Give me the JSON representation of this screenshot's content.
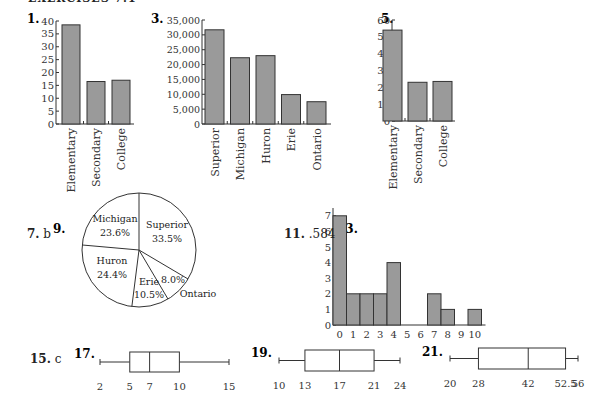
{
  "heading": "EXERCISES 7.1",
  "answers": {
    "ex7": {
      "label": "7.",
      "value": "b"
    },
    "ex11": {
      "label": "11.",
      "value": ".584"
    },
    "ex15": {
      "label": "15.",
      "value": "c"
    }
  },
  "chart_data": [
    {
      "id": "ex1",
      "label": "1.",
      "type": "bar",
      "categories": [
        "Elementary",
        "Secondary",
        "College"
      ],
      "values": [
        38.5,
        16.5,
        17
      ],
      "yticks": [
        0,
        5,
        10,
        15,
        20,
        25,
        30,
        35,
        40
      ],
      "ylim": [
        0,
        40
      ]
    },
    {
      "id": "ex3",
      "label": "3.",
      "type": "bar",
      "categories": [
        "Superior",
        "Michigan",
        "Huron",
        "Erie",
        "Ontario"
      ],
      "values": [
        31700,
        22300,
        23000,
        9900,
        7500
      ],
      "yticks": [
        "0",
        "5,000",
        "10,000",
        "15,000",
        "20,000",
        "25,000",
        "30,000",
        "35,000"
      ],
      "ylim": [
        0,
        35000
      ]
    },
    {
      "id": "ex5",
      "label": "5.",
      "type": "bar",
      "categories": [
        "Elementary",
        "Secondary",
        "College"
      ],
      "values": [
        54,
        23,
        23.5
      ],
      "yticks": [
        0,
        10,
        20,
        30,
        40,
        50,
        60
      ],
      "ylim": [
        0,
        60
      ]
    },
    {
      "id": "ex9",
      "label": "9.",
      "type": "pie",
      "slices": [
        {
          "name": "Superior",
          "pct": "33.5%",
          "value": 33.5
        },
        {
          "name": "Ontario",
          "pct": "8.0%",
          "value": 8.0
        },
        {
          "name": "Erie",
          "pct": "10.5%",
          "value": 10.5
        },
        {
          "name": "Huron",
          "pct": "24.4%",
          "value": 24.4
        },
        {
          "name": "Michigan",
          "pct": "23.6%",
          "value": 23.6
        }
      ]
    },
    {
      "id": "ex13",
      "label": "13.",
      "type": "bar",
      "categories": [
        "0",
        "1",
        "2",
        "3",
        "4",
        "5",
        "6",
        "7",
        "8",
        "9",
        "10"
      ],
      "values": [
        7,
        2,
        2,
        2,
        4,
        0,
        0,
        2,
        1,
        0,
        1
      ],
      "yticks": [
        0,
        1,
        2,
        3,
        4,
        5,
        6,
        7
      ],
      "ylim": [
        0,
        7.5
      ]
    },
    {
      "id": "ex17",
      "label": "17.",
      "type": "boxplot",
      "min": 2,
      "q1": 5,
      "median": 7,
      "q3": 10,
      "max": 15,
      "tick_labels": [
        "2",
        "5",
        "7",
        "10",
        "15"
      ]
    },
    {
      "id": "ex19",
      "label": "19.",
      "type": "boxplot",
      "min": 10,
      "q1": 13,
      "median": 17,
      "q3": 21,
      "max": 24,
      "tick_labels": [
        "10",
        "13",
        "17",
        "21",
        "24"
      ]
    },
    {
      "id": "ex21",
      "label": "21.",
      "type": "boxplot",
      "min": 20,
      "q1": 28,
      "median": 42,
      "q3": 52.5,
      "max": 56,
      "tick_labels": [
        "20",
        "28",
        "42",
        "52.5",
        "56"
      ]
    }
  ]
}
